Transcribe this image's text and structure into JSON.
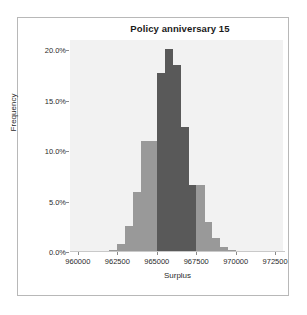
{
  "chart_data": {
    "type": "bar",
    "subtype": "histogram",
    "title": "Policy anniversary 15",
    "xlabel": "Surplus",
    "ylabel": "Frequency",
    "xlim": [
      959500,
      973000
    ],
    "ylim": [
      0,
      21.0
    ],
    "grid": false,
    "legend": null,
    "bin_width": 500,
    "x_tick_values": [
      960000,
      962500,
      965000,
      967500,
      970000,
      972500
    ],
    "x_tick_labels": [
      "960000",
      "962500",
      "965000",
      "967500",
      "970000",
      "972500"
    ],
    "y_tick_values": [
      0,
      5,
      10,
      15,
      20
    ],
    "y_tick_labels": [
      "0.0%",
      "5.0%",
      "10.0%",
      "15.0%",
      "20.0%"
    ],
    "colors": {
      "bar_light": "#999999",
      "bar_dark": "#595959",
      "plot_background": "#f2f2f2",
      "figure_background": "#ffffff",
      "frame": "#b8b8b8",
      "text": "#2b2b2b",
      "axis": "#8a8a8a"
    },
    "categories": [
      "962000",
      "962500",
      "963000",
      "963500",
      "964000",
      "964500",
      "965000",
      "965500",
      "966000",
      "966500",
      "967000",
      "967500",
      "968000",
      "968500",
      "969000",
      "969500",
      "970000"
    ],
    "bin_starts": [
      962000,
      962500,
      963000,
      963500,
      964000,
      964500,
      965000,
      965500,
      966000,
      966500,
      967000,
      967500,
      968000,
      968500,
      969000,
      969500,
      970000
    ],
    "values": [
      0.2,
      0.8,
      2.6,
      5.9,
      11.0,
      11.0,
      17.7,
      20.1,
      18.5,
      12.4,
      6.6,
      6.6,
      3.0,
      1.4,
      0.5,
      0.2,
      0.1
    ],
    "shades": [
      "light",
      "light",
      "light",
      "light",
      "light",
      "light",
      "dark",
      "dark",
      "dark",
      "dark",
      "dark",
      "light",
      "light",
      "light",
      "light",
      "light",
      "light"
    ]
  }
}
